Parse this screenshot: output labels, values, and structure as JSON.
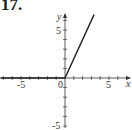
{
  "problem_label": "17.",
  "chart_data": {
    "type": "line",
    "title": "",
    "xlabel": "x",
    "ylabel": "y",
    "xlim": [
      -7.3,
      7.5
    ],
    "ylim": [
      -6,
      7.3
    ],
    "x_ticks": [
      -5,
      0,
      5
    ],
    "y_ticks": [
      -5,
      5
    ],
    "origin_label": "0",
    "grid": false,
    "series": [
      {
        "name": "f(x)",
        "x": [
          -7.3,
          0,
          3.3
        ],
        "y": [
          0,
          0,
          6.6
        ]
      }
    ]
  }
}
